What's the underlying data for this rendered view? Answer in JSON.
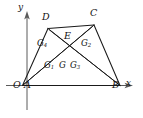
{
  "figure": {
    "background_color": "#ffffff",
    "line_color": "#1a1a1a",
    "axis_color": "#5a5a5a"
  },
  "axes": {
    "x_label": "x",
    "y_label": "y",
    "origin_label": "O",
    "x_axis": {
      "x1": 27,
      "y1": 85.5,
      "x2": 132,
      "y2": 85.5
    },
    "y_axis": {
      "x1": 27,
      "y1": 108,
      "x2": 27,
      "y2": 12
    },
    "x_arrow": "M132,85.5 L124,82.6 L126,85.5 L124,88.4 Z",
    "y_arrow": "M27,12 L24.1,20 L27,18 L29.9,20 Z"
  },
  "vertices": [
    {
      "id": "A",
      "label": "A",
      "x": 22.5,
      "y": 85.5,
      "label_x": 26.5,
      "label_y": 87.0
    },
    {
      "id": "B",
      "label": "B",
      "x": 120.0,
      "y": 85.5,
      "label_x": 115.0,
      "label_y": 87.0
    },
    {
      "id": "C",
      "label": "C",
      "x": 94.0,
      "y": 25.0,
      "label_x": 91.0,
      "label_y": 13.0
    },
    {
      "id": "D",
      "label": "D",
      "x": 48.0,
      "y": 28.5,
      "label_x": 43.5,
      "label_y": 16.5
    }
  ],
  "origin_point": {
    "label": "O",
    "x": 22.5,
    "y": 85.5,
    "label_x": 15.5,
    "label_y": 87.0
  },
  "intersection_point": {
    "label": "E",
    "x": 68.0,
    "y": 47.0,
    "label_x": 65.0,
    "label_y": 36.0
  },
  "centroid_points": [
    {
      "id": "G",
      "label": "G",
      "base": "G",
      "sub": "",
      "label_x": 61.0,
      "label_y": 62.5
    },
    {
      "id": "G1",
      "label": "G1",
      "base": "G",
      "sub": "1",
      "label_x": 47.5,
      "label_y": 62.5
    },
    {
      "id": "G2",
      "label": "G2",
      "base": "G",
      "sub": "2",
      "label_x": 84.0,
      "label_y": 41.5
    },
    {
      "id": "G3",
      "label": "G3",
      "base": "G",
      "sub": "3",
      "label_x": 73.5,
      "label_y": 62.5
    },
    {
      "id": "G4",
      "label": "G4",
      "base": "G",
      "sub": "4",
      "label_x": 40.0,
      "label_y": 41.5
    }
  ],
  "segments": [
    {
      "name": "side-AD",
      "from": "A",
      "to": "D",
      "d": "M22.5,85.5 L48,28.5",
      "kind": "shape"
    },
    {
      "name": "side-DC",
      "from": "D",
      "to": "C",
      "d": "M48,28.5 L94,25",
      "kind": "shape"
    },
    {
      "name": "side-CB",
      "from": "C",
      "to": "B",
      "d": "M94,25 L120,85.5",
      "kind": "shape"
    },
    {
      "name": "side-AB",
      "from": "A",
      "to": "B",
      "d": "M22.5,85.5 L120,85.5",
      "kind": "shape"
    },
    {
      "name": "diagonal-AC",
      "from": "A",
      "to": "C",
      "d": "M22.5,85.5 L94,25",
      "kind": "cevian"
    },
    {
      "name": "diagonal-DB",
      "from": "D",
      "to": "B",
      "d": "M48,28.5 L120,85.5",
      "kind": "cevian"
    },
    {
      "name": "cevian-A-to-C-region",
      "from": "A",
      "to": "E-upper-right",
      "d": "M22.5,85.5 L88,33",
      "kind": "cevian"
    },
    {
      "name": "cevian-D-to-B-region",
      "from": "D",
      "to": "B",
      "d": "M52,35 L118,84",
      "kind": "cevian"
    }
  ]
}
